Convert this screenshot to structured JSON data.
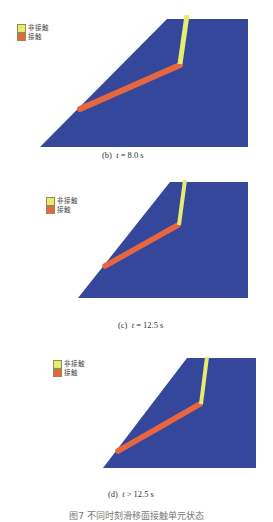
{
  "colors": {
    "slope_body": "#34479a",
    "contact": "#e8663f",
    "non_contact": "#e4ec72",
    "background": "#ffffff"
  },
  "legend": {
    "non_contact_label": "非接触",
    "contact_label": "接触"
  },
  "panels": [
    {
      "id": "b",
      "label": "(b)",
      "time_var": "t",
      "time_text": " = 8.0 s"
    },
    {
      "id": "c",
      "label": "(c)",
      "time_var": "t",
      "time_text": " = 12.5 s"
    },
    {
      "id": "d",
      "label": "(d)",
      "time_var": "t",
      "time_text": " > 12.5 s"
    }
  ],
  "figure_caption": "图7  不同时刻滑移面接触单元状态"
}
